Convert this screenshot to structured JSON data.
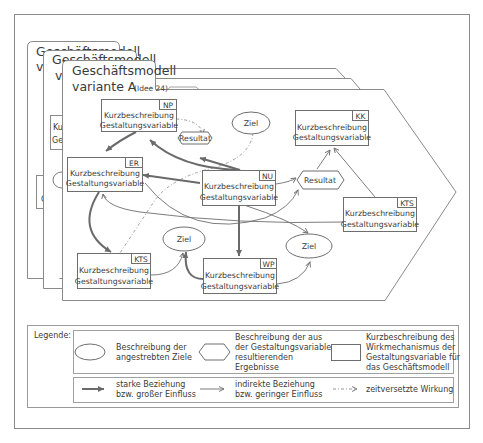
{
  "diagram": {
    "layers": [
      {
        "title_line1": "Geschäftsmodell",
        "title_line2": "v"
      },
      {
        "title_line1": "Geschäftsmodell",
        "title_line2": "v"
      },
      {
        "title_line1": "Geschäftsmodell",
        "title_line2": "variante A",
        "title_suffix": "(Idee 24)"
      }
    ],
    "back_layer_fragments": [
      {
        "text_line1": "Ku",
        "text_line2": "Ge"
      },
      {
        "text_line1": "K",
        "text_line2": "G"
      }
    ],
    "variables": [
      {
        "id": "NP",
        "line1": "Kurzbeschreibung",
        "line2": "Gestaltungsvariable"
      },
      {
        "id": "ER",
        "line1": "Kurzbeschreibung",
        "line2": "Gestaltungsvariable"
      },
      {
        "id": "NU",
        "line1": "Kurzbeschreibung",
        "line2": "Gestaltungsvariable"
      },
      {
        "id": "KK",
        "line1": "Kurzbeschreibung",
        "line2": "Gestaltungsvariable"
      },
      {
        "id": "KTS",
        "line1": "Kurzbeschreibung",
        "line2": "Gestaltungsvariable"
      },
      {
        "id": "KTS",
        "line1": "Kurzbeschreibung",
        "line2": "Gestaltungsvariable"
      },
      {
        "id": "WP",
        "line1": "Kurzbeschreibung",
        "line2": "Gestaltungsvariable"
      }
    ],
    "results": [
      {
        "label": "Resultat"
      },
      {
        "label": "Resultat"
      }
    ],
    "goals": [
      {
        "label": "Ziel"
      },
      {
        "label": "Ziel"
      },
      {
        "label": "Ziel"
      }
    ],
    "colors": {
      "line": "#6e6e6e",
      "strong_line": "#6a6a6a",
      "frame": "#8a8a8a",
      "text": "#3a3a3a",
      "background": "#ffffff"
    }
  },
  "legend": {
    "title": "Legende:",
    "shapes": [
      {
        "icon": "ellipse-icon",
        "line1": "Beschreibung der",
        "line2": "angestrebten Ziele"
      },
      {
        "icon": "hexagon-icon",
        "line1": "Beschreibung der aus",
        "line2": "der Gestaltungsvariable",
        "line3": "resultierenden",
        "line4": "Ergebnisse"
      },
      {
        "icon": "rectangle-icon",
        "line1": "Kurzbeschreibung des",
        "line2": "Wirkmechanismus der",
        "line3": "Gestaltungsvariable für",
        "line4": "das Geschäftsmodell"
      }
    ],
    "arrows": [
      {
        "icon": "strong-arrow-icon",
        "line1": "starke Beziehung",
        "line2": "bzw. großer Einfluss"
      },
      {
        "icon": "thin-arrow-icon",
        "line1": "indirekte Beziehung",
        "line2": "bzw. geringer Einfluss"
      },
      {
        "icon": "dash-dot-arrow-icon",
        "line1": "zeitversetzte Wirkung"
      }
    ]
  }
}
